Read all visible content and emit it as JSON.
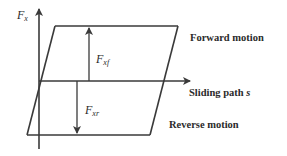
{
  "diagram": {
    "type": "friction-hysteresis-loop",
    "colors": {
      "line": "#3a3a3a",
      "text": "#2b2b2b",
      "background": "#ffffff"
    },
    "axes": {
      "y_label": {
        "symbol": "F",
        "subscript": "x"
      },
      "x_label": {
        "text": "Sliding path ",
        "symbol": "s"
      }
    },
    "forces": {
      "forward": {
        "symbol": "F",
        "subscript": "xf"
      },
      "reverse": {
        "symbol": "F",
        "subscript": "xr"
      }
    },
    "labels": {
      "forward_motion": "Forward motion",
      "reverse_motion": "Reverse motion"
    }
  }
}
